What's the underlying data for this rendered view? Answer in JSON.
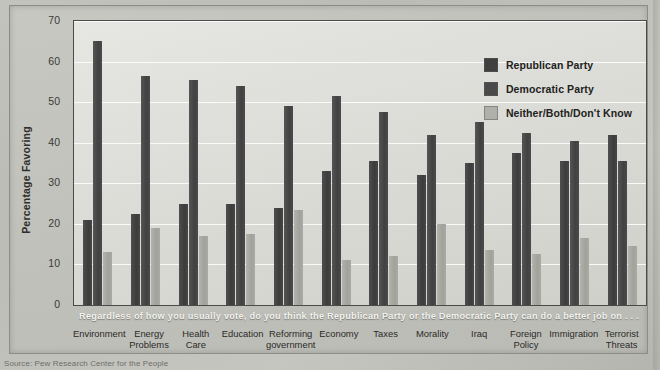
{
  "chart_data": {
    "type": "bar",
    "title": "",
    "xlabel": "",
    "ylabel": "Percentage Favoring",
    "ylim": [
      0,
      70
    ],
    "yticks": [
      0,
      10,
      20,
      30,
      40,
      50,
      60,
      70
    ],
    "grid": true,
    "legend_position": "top-right",
    "question_banner": "Regardless of how you usually vote, do you think the Republican Party or the Democratic Party can do a better job on . . .",
    "categories": [
      "Environment",
      "Energy Problems",
      "Health Care",
      "Education",
      "Reforming government",
      "Economy",
      "Taxes",
      "Morality",
      "Iraq",
      "Foreign Policy",
      "Immigration",
      "Terrorist Threats"
    ],
    "series": [
      {
        "name": "Republican Party",
        "color": "#3f3f3f",
        "values": [
          21,
          22.5,
          25,
          25,
          24,
          33,
          35.5,
          32,
          35,
          37.5,
          35.5,
          42
        ]
      },
      {
        "name": "Democratic Party",
        "color": "#4a4a4a",
        "values": [
          65,
          56.5,
          55.5,
          54,
          49,
          51.5,
          47.5,
          42,
          45,
          42.5,
          40.5,
          35.5
        ]
      },
      {
        "name": "Neither/Both/Don't Know",
        "color": "#b0b0ab",
        "values": [
          13,
          19,
          17,
          17.5,
          23.5,
          11,
          12,
          20,
          13.5,
          12.5,
          16.5,
          14.5
        ]
      }
    ]
  },
  "source": "Source: Pew Research Center for the People"
}
